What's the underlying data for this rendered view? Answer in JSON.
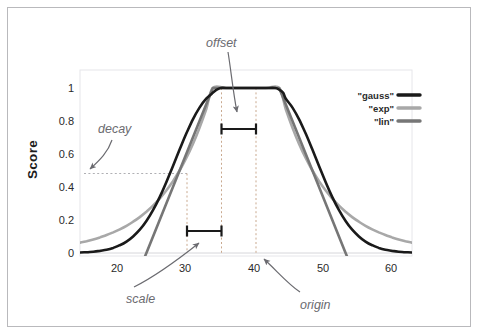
{
  "chart_data": {
    "type": "line",
    "title": "",
    "xlabel": "",
    "ylabel": "Score",
    "xlim": [
      15,
      65
    ],
    "ylim": [
      0,
      1.05
    ],
    "grid": false,
    "legend_position": "top-right",
    "x_ticks": [
      "20",
      "30",
      "40",
      "50",
      "60"
    ],
    "x_tick_values": [
      20,
      30,
      40,
      50,
      60
    ],
    "y_ticks": [
      "0",
      "0.2",
      "0.4",
      "0.6",
      "0.8",
      "1"
    ],
    "y_tick_values": [
      0,
      0.2,
      0.4,
      0.6,
      0.8,
      1
    ],
    "origin": 40,
    "offset": 5,
    "scale": 5,
    "decay": 0.5,
    "plateau": [
      35,
      45
    ],
    "series": [
      {
        "name": "\"gauss\"",
        "color": "#1a1a1a",
        "width": 2.6,
        "points": [
          [
            15.0,
            0.003
          ],
          [
            16.0,
            0.005
          ],
          [
            17.0,
            0.008
          ],
          [
            18.0,
            0.013
          ],
          [
            19.0,
            0.02
          ],
          [
            20.0,
            0.031
          ],
          [
            21.0,
            0.047
          ],
          [
            22.0,
            0.069
          ],
          [
            23.0,
            0.1
          ],
          [
            24.0,
            0.141
          ],
          [
            25.0,
            0.194
          ],
          [
            26.0,
            0.26
          ],
          [
            27.0,
            0.339
          ],
          [
            28.0,
            0.429
          ],
          [
            29.0,
            0.527
          ],
          [
            30.0,
            0.627
          ],
          [
            31.0,
            0.723
          ],
          [
            32.0,
            0.81
          ],
          [
            33.0,
            0.881
          ],
          [
            34.0,
            0.935
          ],
          [
            35.0,
            0.971
          ],
          [
            35.6,
            0.99
          ],
          [
            36.2,
            1.0
          ],
          [
            37.0,
            1.0
          ],
          [
            39.0,
            1.0
          ],
          [
            41.0,
            1.0
          ],
          [
            43.0,
            1.0
          ],
          [
            44.4,
            1.0
          ],
          [
            45.0,
            0.99
          ],
          [
            45.6,
            0.971
          ],
          [
            46.0,
            0.935
          ],
          [
            47.0,
            0.881
          ],
          [
            48.0,
            0.81
          ],
          [
            49.0,
            0.723
          ],
          [
            50.0,
            0.627
          ],
          [
            51.0,
            0.527
          ],
          [
            52.0,
            0.429
          ],
          [
            53.0,
            0.339
          ],
          [
            54.0,
            0.26
          ],
          [
            55.0,
            0.194
          ],
          [
            56.0,
            0.141
          ],
          [
            57.0,
            0.1
          ],
          [
            58.0,
            0.069
          ],
          [
            59.0,
            0.047
          ],
          [
            60.0,
            0.031
          ],
          [
            61.0,
            0.02
          ],
          [
            62.0,
            0.013
          ],
          [
            63.0,
            0.008
          ],
          [
            64.0,
            0.005
          ],
          [
            65.0,
            0.003
          ]
        ]
      },
      {
        "name": "\"exp\"",
        "color": "#a8a8a8",
        "width": 2.6,
        "points": [
          [
            15.0,
            0.0625
          ],
          [
            16.0,
            0.0718
          ],
          [
            17.0,
            0.0825
          ],
          [
            18.0,
            0.0948
          ],
          [
            19.0,
            0.1088
          ],
          [
            20.0,
            0.125
          ],
          [
            21.0,
            0.1436
          ],
          [
            22.0,
            0.1649
          ],
          [
            23.0,
            0.1895
          ],
          [
            24.0,
            0.2176
          ],
          [
            25.0,
            0.25
          ],
          [
            26.0,
            0.2872
          ],
          [
            27.0,
            0.3299
          ],
          [
            28.0,
            0.3789
          ],
          [
            29.0,
            0.4353
          ],
          [
            30.0,
            0.5
          ],
          [
            31.0,
            0.5743
          ],
          [
            32.0,
            0.6598
          ],
          [
            33.0,
            0.7579
          ],
          [
            34.0,
            0.8706
          ],
          [
            35.0,
            1.0
          ],
          [
            37.0,
            1.0
          ],
          [
            40.0,
            1.0
          ],
          [
            43.0,
            1.0
          ],
          [
            45.0,
            1.0
          ],
          [
            46.0,
            0.8706
          ],
          [
            47.0,
            0.7579
          ],
          [
            48.0,
            0.6598
          ],
          [
            49.0,
            0.5743
          ],
          [
            50.0,
            0.5
          ],
          [
            51.0,
            0.4353
          ],
          [
            52.0,
            0.3789
          ],
          [
            53.0,
            0.3299
          ],
          [
            54.0,
            0.2872
          ],
          [
            55.0,
            0.25
          ],
          [
            56.0,
            0.2176
          ],
          [
            57.0,
            0.1895
          ],
          [
            58.0,
            0.1649
          ],
          [
            59.0,
            0.1436
          ],
          [
            60.0,
            0.125
          ],
          [
            61.0,
            0.1088
          ],
          [
            62.0,
            0.0948
          ],
          [
            63.0,
            0.0825
          ],
          [
            64.0,
            0.0718
          ],
          [
            65.0,
            0.0625
          ]
        ]
      },
      {
        "name": "\"lin\"",
        "color": "#767676",
        "width": 2.6,
        "points": [
          [
            24.6,
            -0.04
          ],
          [
            25.0,
            0.0
          ],
          [
            30.0,
            0.5
          ],
          [
            35.0,
            1.0
          ],
          [
            40.0,
            1.0
          ],
          [
            45.0,
            1.0
          ],
          [
            50.0,
            0.5
          ],
          [
            55.0,
            0.0
          ],
          [
            55.4,
            -0.04
          ]
        ]
      }
    ],
    "annotations": [
      {
        "id": "offset",
        "label": "offset",
        "text_x": 206,
        "text_y": 36,
        "arrow": "curve from label down-right to plateau interior",
        "bracket": {
          "from_x": 35,
          "to_x": 40,
          "y": 0.78
        }
      },
      {
        "id": "decay",
        "label": "decay",
        "text_x": 98,
        "text_y": 122,
        "arrow": "curve from label down-left toward 0.5 dotted line",
        "guide": {
          "type": "hline",
          "y": 0.5,
          "from_x": 15,
          "to_x": 30
        }
      },
      {
        "id": "scale",
        "label": "scale",
        "text_x": 126,
        "text_y": 292,
        "arrow": "curve from label up-right to scale bracket",
        "bracket": {
          "from_x": 30,
          "to_x": 35,
          "y": 0.145
        }
      },
      {
        "id": "origin",
        "label": "origin",
        "text_x": 300,
        "text_y": 298,
        "arrow": "curve from label up-left to x=40 baseline",
        "guide": {
          "type": "vline",
          "x": 40
        }
      }
    ],
    "guide_lines": {
      "vertical_dotted_x": [
        30,
        35,
        40
      ],
      "horizontal_dotted_y": [
        0.5
      ]
    }
  },
  "frame": {
    "border_color": "#b9b9bc",
    "background": "#ffffff"
  },
  "legend": {
    "entries": [
      {
        "label": "\"gauss\"",
        "color": "#1a1a1a"
      },
      {
        "label": "\"exp\"",
        "color": "#a8a8a8"
      },
      {
        "label": "\"lin\"",
        "color": "#767676"
      }
    ]
  }
}
